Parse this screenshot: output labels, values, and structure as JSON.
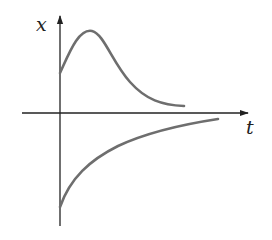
{
  "diagram": {
    "type": "phase-line-solution-curves",
    "axes": {
      "vertical_label": "x",
      "horizontal_label": "t",
      "axis_color": "#222222"
    },
    "curves": [
      {
        "name": "upper-solution-curve",
        "description": "starts above axis, rises to a peak, then decays toward t-axis",
        "color": "#6e6e6e"
      },
      {
        "name": "lower-solution-curve",
        "description": "starts well below axis, rises and approaches t-axis from below",
        "color": "#6e6e6e"
      }
    ]
  }
}
